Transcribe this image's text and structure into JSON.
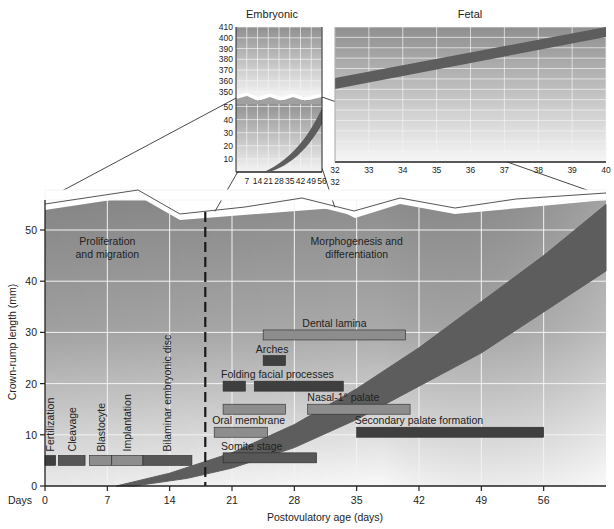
{
  "chart_data": [
    {
      "id": "main",
      "type": "area",
      "title": "",
      "xlabel": "Postovulatory age (days)",
      "x_axis_prefix": "Days",
      "ylabel": "Crown-rump length (mm)",
      "xlim": [
        0,
        63
      ],
      "ylim": [
        0,
        55
      ],
      "x_ticks": [
        0,
        7,
        14,
        21,
        28,
        35,
        42,
        49,
        56
      ],
      "y_ticks": [
        0,
        10,
        20,
        30,
        40,
        50
      ],
      "grid": true,
      "divider_day": 18,
      "phase_labels": [
        {
          "text": [
            "Proliferation",
            "and migration"
          ],
          "x": 7,
          "y": 47
        },
        {
          "text": [
            "Morphogenesis and",
            "differentiation"
          ],
          "x": 35,
          "y": 47
        }
      ],
      "growth_band": {
        "name": "Crown-rump length range",
        "upper": [
          [
            8,
            0
          ],
          [
            14,
            2.5
          ],
          [
            21,
            6.5
          ],
          [
            28,
            12
          ],
          [
            35,
            19
          ],
          [
            42,
            27
          ],
          [
            49,
            36
          ],
          [
            56,
            45
          ],
          [
            63,
            55
          ]
        ],
        "lower": [
          [
            10,
            0
          ],
          [
            16,
            1.5
          ],
          [
            21,
            3.5
          ],
          [
            28,
            7.5
          ],
          [
            35,
            13
          ],
          [
            42,
            19.5
          ],
          [
            49,
            26
          ],
          [
            56,
            34
          ],
          [
            63,
            42
          ]
        ]
      },
      "bars": [
        {
          "label": "Fertilization",
          "start": 0,
          "end": 1.2,
          "y": 5,
          "shade": "dark",
          "vertical_label": true
        },
        {
          "label": "Cleavage",
          "start": 1.5,
          "end": 4.5,
          "y": 5,
          "shade": "medium-dark",
          "vertical_label": true
        },
        {
          "label": "Blastocyte",
          "start": 5,
          "end": 7.5,
          "y": 5,
          "shade": "light",
          "vertical_label": true
        },
        {
          "label": "Implantation",
          "start": 7.5,
          "end": 11,
          "y": 5,
          "shade": "light",
          "vertical_label": true
        },
        {
          "label": "Bilaminar embryonic disc",
          "start": 11,
          "end": 16.5,
          "y": 5,
          "shade": "medium-dark",
          "vertical_label": true
        },
        {
          "label": "Somite stage",
          "start": 20,
          "end": 30.5,
          "y": 5.5,
          "shade": "medium-dark"
        },
        {
          "label": "Oral membrane",
          "start": 19,
          "end": 25,
          "y": 10.5,
          "shade": "light"
        },
        {
          "label": "Nasal-1° palate",
          "start": 20,
          "end": 27,
          "y": 15,
          "shade": "light",
          "label_x": 33.5
        },
        {
          "label": "",
          "start": 29.5,
          "end": 41,
          "y": 15,
          "shade": "light"
        },
        {
          "label": "Secondary palate formation",
          "start": 35,
          "end": 56,
          "y": 10.5,
          "shade": "dark"
        },
        {
          "label": "Folding facial processes",
          "start": 20,
          "end": 22.5,
          "y": 19.5,
          "shade": "dark"
        },
        {
          "label": "",
          "start": 23.5,
          "end": 33.5,
          "y": 19.5,
          "shade": "dark"
        },
        {
          "label": "Arches",
          "start": 24.5,
          "end": 27,
          "y": 24.5,
          "shade": "dark",
          "label_x": 25.5
        },
        {
          "label": "Dental lamina",
          "start": 24.5,
          "end": 40.5,
          "y": 29.5,
          "shade": "light",
          "label_x": 32.5
        }
      ]
    },
    {
      "id": "inset-embryonic",
      "type": "area",
      "title": "Embryonic",
      "x_ticks": [
        7,
        14,
        21,
        28,
        35,
        42,
        49,
        56
      ],
      "x_secondary": [
        {
          "label": "4",
          "at": 28
        },
        {
          "label": "8",
          "at": 56
        }
      ],
      "y_ticks_upper": [
        350,
        360,
        370,
        380,
        390,
        400,
        410
      ],
      "y_ticks_lower": [
        10,
        20,
        30,
        40,
        50
      ],
      "axis_break": true,
      "grid": true
    },
    {
      "id": "inset-fetal",
      "type": "area",
      "title": "Fetal",
      "x_ticks": [
        32,
        33,
        34,
        35,
        36,
        37,
        38,
        39,
        40
      ],
      "x_secondary": [
        {
          "label": "32",
          "at": 32
        }
      ],
      "band": {
        "start": [
          32,
          350
        ],
        "end": [
          40,
          405
        ],
        "thickness": 12
      },
      "grid": true
    }
  ],
  "colors": {
    "grid": "#f2f2f2",
    "band": "#5d5d5d",
    "bar_dark": "#3f3f3f",
    "bar_medium_dark": "#575757",
    "bar_light": "#8d8d8d",
    "bg_top": "#8e8e8e",
    "bg_bottom": "#f7f7f7"
  }
}
